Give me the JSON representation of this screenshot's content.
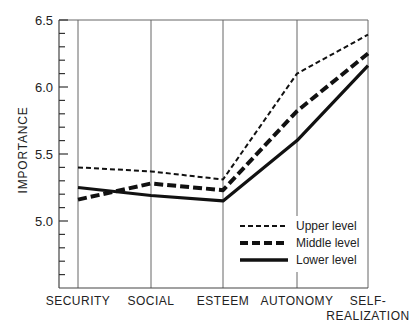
{
  "chart_data": {
    "type": "line",
    "title": "",
    "xlabel": "",
    "ylabel": "IMPORTANCE",
    "categories": [
      "SECURITY",
      "SOCIAL",
      "ESTEEM",
      "AUTONOMY",
      "SELF-REALIZATION"
    ],
    "category_display": [
      [
        "SECURITY"
      ],
      [
        "SOCIAL"
      ],
      [
        "ESTEEM"
      ],
      [
        "AUTONOMY"
      ],
      [
        "SELF-",
        "REALIZATION"
      ]
    ],
    "ylim": [
      4.5,
      6.5
    ],
    "yticks_major": [
      5.0,
      5.5,
      6.0,
      6.5
    ],
    "ytick_labels": [
      "5.0",
      "5.5",
      "6.0",
      "6.5"
    ],
    "ytick_minor_step": 0.1,
    "grid": "vertical lines at each category",
    "legend_position": "lower right",
    "series": [
      {
        "name": "Upper level",
        "style": "dashed-thin",
        "values": [
          5.4,
          5.37,
          5.31,
          6.1,
          6.39
        ]
      },
      {
        "name": "Middle level",
        "style": "dashed-thick",
        "values": [
          5.16,
          5.28,
          5.23,
          5.82,
          6.25
        ]
      },
      {
        "name": "Lower level",
        "style": "solid-thick",
        "values": [
          5.25,
          5.19,
          5.15,
          5.6,
          6.16
        ]
      }
    ]
  },
  "legend": {
    "items": [
      "Upper level",
      "Middle level",
      "Lower level"
    ]
  },
  "colors": {
    "line": "#111111",
    "grid": "#555555",
    "background": "#ffffff"
  }
}
